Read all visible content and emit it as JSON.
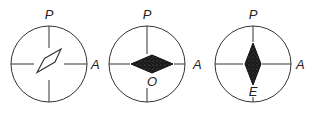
{
  "figure": {
    "panels": [
      {
        "id": "panel-1",
        "top_label": "P",
        "right_label": "A",
        "bottom_label": "",
        "crystal_shape": "parallelogram-outline",
        "crystal_fill": "none"
      },
      {
        "id": "panel-2",
        "top_label": "P",
        "right_label": "A",
        "bottom_label": "O",
        "crystal_shape": "horizontal-diamond",
        "crystal_fill": "dark-speckled"
      },
      {
        "id": "panel-3",
        "top_label": "P",
        "right_label": "A",
        "bottom_label": "E",
        "crystal_shape": "vertical-diamond",
        "crystal_fill": "dark-speckled"
      }
    ],
    "colors": {
      "line": "#333333",
      "fill": "#1a1a1a",
      "background": "#ffffff"
    }
  }
}
